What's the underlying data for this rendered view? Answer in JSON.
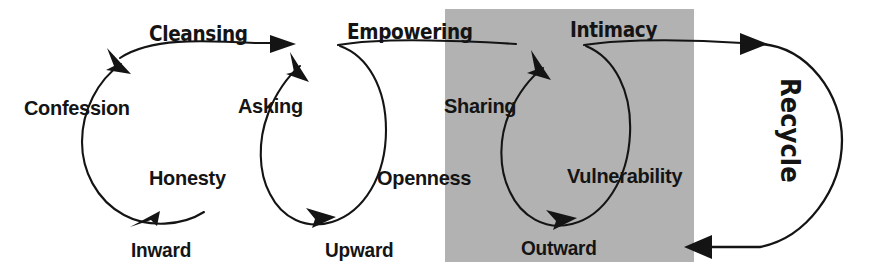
{
  "diagram": {
    "phases": [
      {
        "id": "cleansing",
        "label": "Cleansing"
      },
      {
        "id": "empowering",
        "label": "Empowering"
      },
      {
        "id": "intimacy",
        "label": "Intimacy"
      }
    ],
    "cycles": [
      {
        "id": "inward",
        "direction_label": "Inward",
        "phase_label": "Cleansing",
        "nodes": [
          {
            "id": "confession",
            "label": "Confession"
          },
          {
            "id": "honesty",
            "label": "Honesty"
          }
        ],
        "highlighted": false
      },
      {
        "id": "upward",
        "direction_label": "Upward",
        "phase_label": "Empowering",
        "nodes": [
          {
            "id": "asking",
            "label": "Asking"
          },
          {
            "id": "openness",
            "label": "Openness"
          }
        ],
        "highlighted": false
      },
      {
        "id": "outward",
        "direction_label": "Outward",
        "phase_label": "Intimacy",
        "nodes": [
          {
            "id": "sharing",
            "label": "Sharing"
          },
          {
            "id": "vulnerability",
            "label": "Vulnerability"
          }
        ],
        "highlighted": true
      }
    ],
    "return_arrow": {
      "id": "recycle",
      "label": "Recycle"
    },
    "colors": {
      "stroke": "#141414",
      "text": "#141414",
      "background": "#ffffff",
      "highlight_box": "#b3b3b3"
    }
  }
}
